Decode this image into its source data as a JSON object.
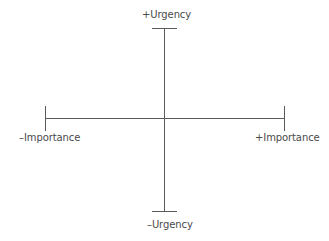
{
  "diagram": {
    "type": "quadrant-axes",
    "axes": {
      "vertical": {
        "name": "Urgency",
        "positive_label": "+Urgency",
        "negative_label": "–Urgency"
      },
      "horizontal": {
        "name": "Importance",
        "positive_label": "+Importance",
        "negative_label": "–Importance"
      }
    },
    "colors": {
      "line": "#5a5a5a",
      "text": "#4a4a4a",
      "background": "#ffffff"
    }
  }
}
